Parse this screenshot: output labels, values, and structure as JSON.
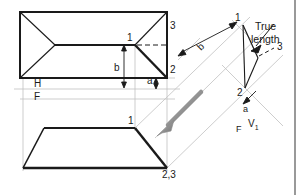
{
  "figure": {
    "type": "technical-drawing",
    "width": 307,
    "height": 195,
    "background": "#ffffff",
    "line_color": "#1a1a1a",
    "construction_color": "#b8b8b8",
    "arrow_color": "#8c8c8c"
  },
  "labels": {
    "top_view_point_1": "1",
    "top_view_point_3": "3",
    "top_view_point_2": "2",
    "dim_b": "b",
    "dim_a": "a",
    "ref_h": "H",
    "ref_f": "F",
    "front_view_point_1": "1",
    "front_view_point_23": "2,3",
    "aux_point_1": "1",
    "aux_point_3": "3",
    "aux_point_2": "2",
    "aux_dim_b": "b",
    "aux_dim_a": "a",
    "aux_ref_f": "F",
    "aux_ref_v1": "V",
    "aux_ref_v1_sub": "1",
    "true_length_line1": "True",
    "true_length_line2": "length"
  },
  "geometry": {
    "top_view": {
      "outline": "20,12 167,12 167,78 20,78",
      "apex_left": "55,45",
      "point_1": "135,45",
      "point_2": "167,78",
      "point_3": "167,12"
    },
    "front_view": {
      "outline": "23,168 44,128 135,128 167,168",
      "point_1": "135,128",
      "point_23": "167,168"
    },
    "reference_lines": {
      "h_f_line_y": 89,
      "upper_line_y": 78,
      "lower_line_y": 99
    },
    "aux_view": {
      "point_1": "243,25",
      "point_2": "245,88",
      "point_3": "277,48",
      "fold_angle_deg": -45
    },
    "arrow": {
      "from": "201,92",
      "to": "159,134"
    }
  }
}
